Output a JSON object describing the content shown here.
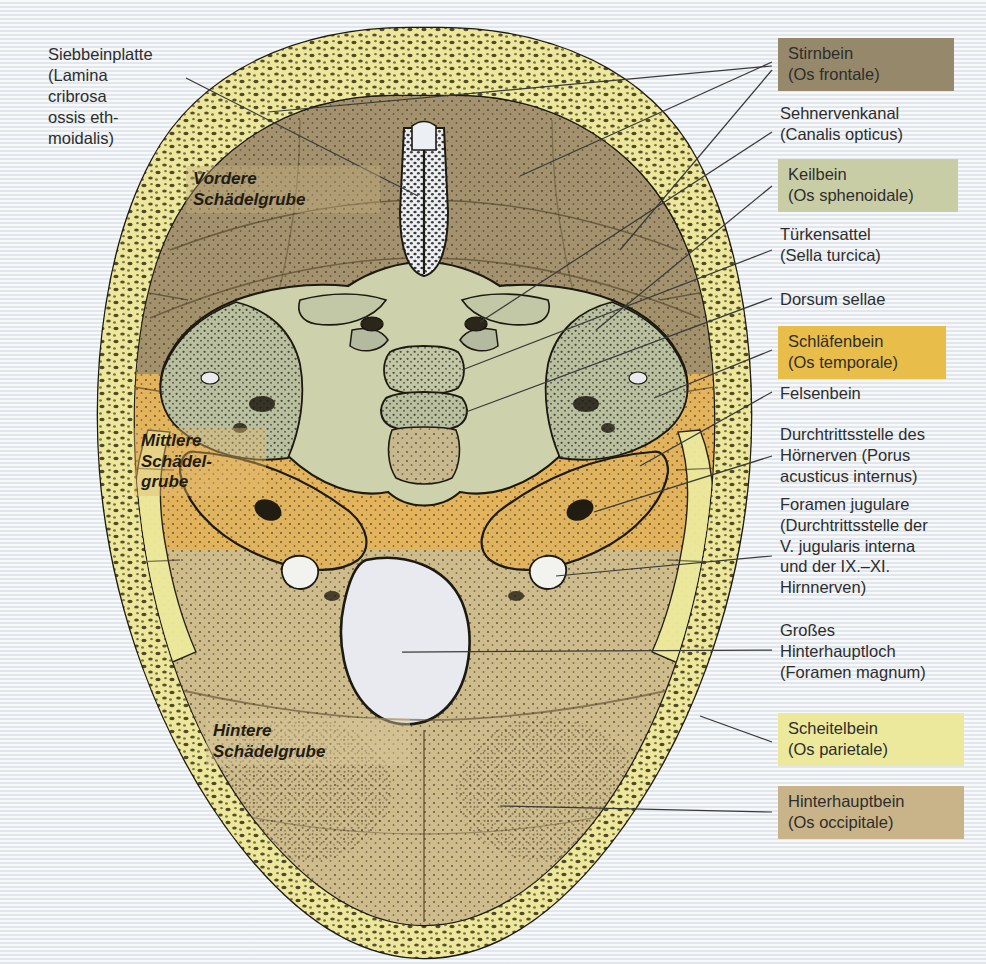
{
  "figure": {
    "background_color": "#eef1f3"
  },
  "left_labels": [
    {
      "name": "siebbeinplatte",
      "text": "Siebbeinplatte\n(Lamina\ncribrosa\nossis eth-\nmoidalis)"
    }
  ],
  "fossa_labels": [
    {
      "name": "vordere-schaedelgrube",
      "text": "Vordere\nSchädelgrube",
      "box_color": "rgba(196,176,126,0.40)"
    },
    {
      "name": "mittlere-schaedelgrube",
      "text": "Mittlere\nSchädel-\ngrube",
      "box_color": "rgba(226,186,110,0.42)"
    },
    {
      "name": "hintere-schaedelgrube",
      "text": "Hintere\nSchädelgrube",
      "box_color": "rgba(216,200,152,0.45)"
    }
  ],
  "right_labels": [
    {
      "name": "stirnbein",
      "text": "Stirnbein\n(Os frontale)",
      "swatch": true,
      "color": "#96896b",
      "top": 38,
      "width": 176
    },
    {
      "name": "sehnervenkanal",
      "text": "Sehnervenkanal\n(Canalis opticus)",
      "swatch": false,
      "color": "",
      "top": 103,
      "width": 200
    },
    {
      "name": "keilbein",
      "text": "Keilbein\n(Os sphenoidale)",
      "swatch": true,
      "color": "#c9cda6",
      "top": 159,
      "width": 180
    },
    {
      "name": "tuerkensattel",
      "text": "Türkensattel\n(Sella turcica)",
      "swatch": false,
      "color": "",
      "top": 224,
      "width": 200
    },
    {
      "name": "dorsum-sellae",
      "text": "Dorsum sellae",
      "swatch": false,
      "color": "",
      "top": 289,
      "width": 200
    },
    {
      "name": "schlaefenbein",
      "text": "Schläfenbein\n(Os temporale)",
      "swatch": true,
      "color": "#e9bd49",
      "top": 326,
      "width": 168
    },
    {
      "name": "felsenbein",
      "text": "Felsenbein",
      "swatch": false,
      "color": "",
      "top": 383,
      "width": 200
    },
    {
      "name": "porus-acusticus-internus",
      "text": "Durchtrittsstelle des\nHörnerven (Porus\nacusticus internus)",
      "swatch": false,
      "color": "",
      "top": 424,
      "width": 208
    },
    {
      "name": "foramen-jugulare",
      "text": "Foramen jugulare\n(Durchtrittsstelle der\nV. jugularis interna\nund der IX.–XI.\nHirnnerven)",
      "swatch": false,
      "color": "",
      "top": 494,
      "width": 208
    },
    {
      "name": "foramen-magnum",
      "text": "Großes\nHinterhauptloch\n(Foramen magnum)",
      "swatch": false,
      "color": "",
      "top": 620,
      "width": 208
    },
    {
      "name": "scheitelbein",
      "text": "Scheitelbein\n(Os parietale)",
      "swatch": true,
      "color": "#ece99c",
      "top": 713,
      "width": 186
    },
    {
      "name": "hinterhauptbein",
      "text": "Hinterhauptbein\n(Os occipitale)",
      "swatch": true,
      "color": "#c9b489",
      "top": 786,
      "width": 186
    }
  ],
  "anatomy_colors": {
    "frontal_bone": "#a3926d",
    "sphenoid_bone": "#cdd2ad",
    "temporal_bone": "#e3b45c",
    "parietal_diploe": "#ece79b",
    "occipital_bone": "#cfbc8c",
    "petrous_part": "#b8bda0",
    "foramen_magnum": "#e8eaf0",
    "outline": "#241f16",
    "leader_line": "#3a3a3a"
  }
}
